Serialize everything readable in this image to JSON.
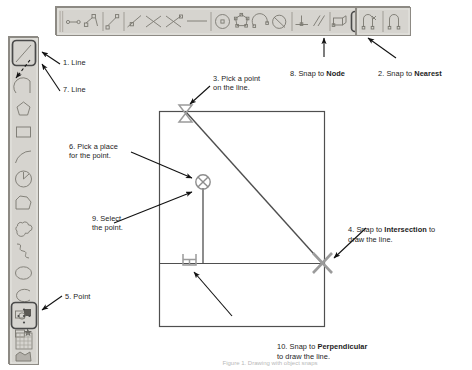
{
  "figure": {
    "caption": "Figure 1. Drawing with object snaps"
  },
  "colors": {
    "toolbar_face": "#d6d4cf",
    "toolbar_border": "#8d8a84",
    "icon_stroke": "#7a7870",
    "highlight_border": "#4a4a4a",
    "geometry_stroke": "#4f4f4f",
    "snap_marker": "#9b9b9b",
    "leader_line": "#111111",
    "text": "#1c1c1c",
    "canvas": "#ffffff"
  },
  "top_toolbar": {
    "name": "Draw toolbar",
    "orientation": "horizontal",
    "tools": [
      {
        "id": "t1",
        "icon": "polyline-node-icon",
        "highlighted": false
      },
      {
        "id": "t2",
        "icon": "polyline-square-node-icon",
        "highlighted": false
      },
      {
        "id": "t3",
        "icon": "line-node-icon",
        "highlighted": false
      },
      {
        "id": "t4",
        "icon": "line-slope-node-icon",
        "highlighted": false
      },
      {
        "id": "t5",
        "icon": "cross-lines-icon",
        "highlighted": false
      },
      {
        "id": "t6",
        "icon": "cross-lines-node-icon",
        "highlighted": false
      },
      {
        "id": "t7",
        "icon": "dash-line-icon",
        "highlighted": false
      },
      {
        "id": "t8",
        "icon": "circle-center-icon",
        "highlighted": false
      },
      {
        "id": "t9",
        "icon": "polygon-snap-icon",
        "highlighted": false
      },
      {
        "id": "t10",
        "icon": "arc-snap-icon",
        "highlighted": false
      },
      {
        "id": "t11",
        "icon": "circle-tangent-icon",
        "highlighted": false
      },
      {
        "id": "t12",
        "icon": "perpendicular-snap-icon",
        "highlighted": false
      },
      {
        "id": "t13",
        "icon": "parallel-snap-icon",
        "highlighted": false
      },
      {
        "id": "t14",
        "icon": "insert-snap-icon",
        "highlighted": false
      },
      {
        "id": "t15",
        "icon": "node-snap-icon",
        "highlighted": true
      },
      {
        "id": "t16",
        "icon": "nearest-snap-icon",
        "highlighted": true
      },
      {
        "id": "t17",
        "icon": "none-snap-icon",
        "highlighted": false
      },
      {
        "id": "t18",
        "icon": "quadrant-snap-icon",
        "highlighted": false
      }
    ]
  },
  "left_toolbar": {
    "name": "Draw tools toolbar",
    "orientation": "vertical",
    "tools": [
      {
        "id": "L1",
        "icon": "line-icon",
        "highlighted": true
      },
      {
        "id": "L2",
        "icon": "arc-bulge-icon",
        "highlighted": false
      },
      {
        "id": "L3",
        "icon": "polygon-icon",
        "highlighted": false
      },
      {
        "id": "L4",
        "icon": "rectangle-icon",
        "highlighted": false
      },
      {
        "id": "L5",
        "icon": "arc-icon",
        "highlighted": false
      },
      {
        "id": "L6",
        "icon": "circle-radius-icon",
        "highlighted": false
      },
      {
        "id": "L7",
        "icon": "freeform-shape-icon",
        "highlighted": false
      },
      {
        "id": "L8",
        "icon": "cloud-icon",
        "highlighted": false
      },
      {
        "id": "L9",
        "icon": "spline-icon",
        "highlighted": false
      },
      {
        "id": "L10",
        "icon": "ellipse-icon",
        "highlighted": false
      },
      {
        "id": "L11",
        "icon": "ellipse-arc-icon",
        "highlighted": false
      },
      {
        "id": "L12",
        "icon": "block-insert-icon",
        "highlighted": false
      },
      {
        "id": "L13",
        "icon": "block-define-icon",
        "highlighted": false
      },
      {
        "id": "L14",
        "icon": "point-icon",
        "highlighted": true
      },
      {
        "id": "L15",
        "icon": "hatch-icon",
        "highlighted": false
      },
      {
        "id": "L16",
        "icon": "region-icon",
        "highlighted": false
      }
    ]
  },
  "canvas": {
    "name": "drawing-canvas",
    "geometry": [
      {
        "id": "g1",
        "type": "rectangle",
        "name": "outer-rectangle"
      },
      {
        "id": "g2",
        "type": "line",
        "name": "diagonal-line"
      },
      {
        "id": "g3",
        "type": "line",
        "name": "horizontal-line"
      },
      {
        "id": "g4",
        "type": "line",
        "name": "vertical-line"
      }
    ],
    "markers": [
      {
        "id": "m1",
        "name": "nearest-snap-marker",
        "glyph": "hourglass"
      },
      {
        "id": "m2",
        "name": "node-snap-marker",
        "glyph": "circle-x"
      },
      {
        "id": "m3",
        "name": "intersection-snap-marker",
        "glyph": "x-cross"
      },
      {
        "id": "m4",
        "name": "perpendicular-snap-marker",
        "glyph": "right-angle"
      }
    ]
  },
  "callouts": [
    {
      "id": "c1",
      "num": "1.",
      "text": "Line",
      "bold": ""
    },
    {
      "id": "c7",
      "num": "7.",
      "text": "Line",
      "bold": ""
    },
    {
      "id": "c5",
      "num": "5.",
      "text": "Point",
      "bold": ""
    },
    {
      "id": "c8",
      "num": "8.",
      "text": "Snap to ",
      "bold": "Node",
      "tail": ""
    },
    {
      "id": "c2",
      "num": "2.",
      "text": "Snap to ",
      "bold": "Nearest",
      "tail": ""
    },
    {
      "id": "c3",
      "num": "3.",
      "text": "Pick a point\non the line.",
      "bold": ""
    },
    {
      "id": "c6",
      "num": "6.",
      "text": "Pick a place\nfor the point.",
      "bold": ""
    },
    {
      "id": "c9",
      "num": "9.",
      "text": "Select\nthe point.",
      "bold": ""
    },
    {
      "id": "c4",
      "num": "4.",
      "text": "Snap to ",
      "bold": "Intersection",
      "tail": " to\ndraw the line."
    },
    {
      "id": "c10",
      "num": "10.",
      "text": "Snap to ",
      "bold": "Perpendicular",
      "tail": "\nto draw the line."
    }
  ],
  "callout_text": {
    "c1": "1. Line",
    "c7": "7. Line",
    "c5": "5. Point",
    "c3": "3. Pick a point\non the line.",
    "c6": "6. Pick a place\nfor the point.",
    "c9": "9. Select\nthe point."
  }
}
